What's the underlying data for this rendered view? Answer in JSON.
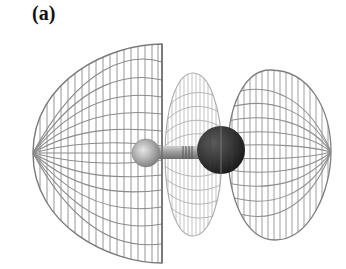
{
  "figure": {
    "panel_label": "(a)",
    "colors": {
      "background": "#ffffff",
      "mesh_outer": "#8a8a8a",
      "mesh_middle": "#b4b4b4",
      "small_atom": "#a8a8a8",
      "large_atom": "#2e2e2e",
      "bond": "#9a9a9a"
    },
    "lobes": [
      {
        "name": "left-lobe",
        "x_min": 33,
        "x_max": 163,
        "y_min": 44,
        "y_max": 263
      },
      {
        "name": "middle-lobe",
        "x_min": 165,
        "x_max": 222,
        "y_min": 73,
        "y_max": 236
      },
      {
        "name": "right-lobe",
        "x_min": 228,
        "x_max": 331,
        "y_min": 70,
        "y_max": 240
      }
    ],
    "atoms": [
      {
        "name": "small-atom",
        "cx": 146,
        "cy": 153,
        "r": 14
      },
      {
        "name": "large-atom",
        "cx": 221,
        "cy": 150,
        "r": 24
      }
    ]
  }
}
